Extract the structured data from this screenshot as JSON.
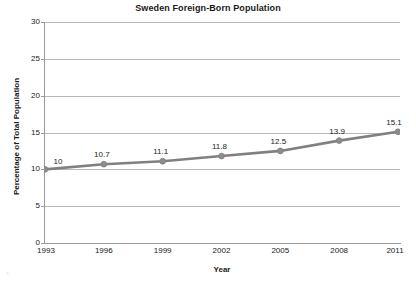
{
  "chart_data": {
    "type": "line",
    "title": "Sweden Foreign-Born Population",
    "xlabel": "Year",
    "ylabel": "Percentage of Total Population",
    "categories": [
      "1993",
      "1996",
      "1999",
      "2002",
      "2005",
      "2008",
      "2011"
    ],
    "values": [
      10,
      10.7,
      11.1,
      11.8,
      12.5,
      13.9,
      15.1
    ],
    "data_labels": [
      "10",
      "10.7",
      "11.1",
      "11.8",
      "12.5",
      "13.9",
      "15.1"
    ],
    "ylim": [
      0,
      30
    ],
    "ytick_step": 5,
    "yticks": [
      "0",
      "5",
      "10",
      "15",
      "20",
      "25",
      "30"
    ],
    "grid": "horizontal",
    "legend": "none",
    "series_color": "#808080",
    "marker": "circle",
    "marker_color": "#8c8c8c",
    "gridline_color": "#b9b9b9",
    "axis_color": "#9a9a9a",
    "text_color": "#1a1a1a",
    "background": "#ffffff"
  },
  "artifact": {
    "mark": "°"
  }
}
